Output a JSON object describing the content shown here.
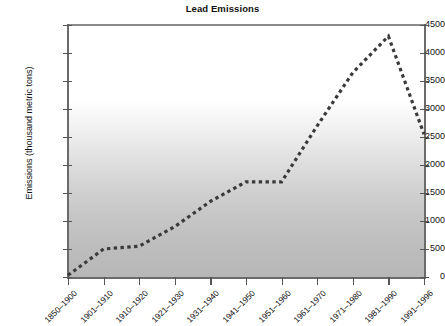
{
  "chart_data": {
    "type": "line",
    "title": "Lead Emissions",
    "xlabel": "",
    "ylabel": "Emissions (thousand metric tons)",
    "ylim": [
      0,
      4500
    ],
    "ytick_step": 500,
    "yticks": [
      0,
      500,
      1000,
      1500,
      2000,
      2500,
      3000,
      3500,
      4000,
      4500
    ],
    "ytick_labels": [
      "0",
      "500",
      "1000",
      "1500",
      "2000",
      "2500",
      "3000",
      "3500",
      "4000",
      "4500"
    ],
    "grid": false,
    "legend": "none",
    "line_style": "dotted",
    "line_color": "#3a3a3a",
    "plot_background": "vertical gradient white to gray",
    "categories": [
      "1850–1900",
      "1901–1910",
      "1910–1920",
      "1921–1930",
      "1931–1940",
      "1941–1950",
      "1951–1960",
      "1961–1970",
      "1971–1980",
      "1981–1990",
      "1991–1996"
    ],
    "values": [
      30,
      500,
      550,
      900,
      1350,
      1700,
      1700,
      2700,
      3650,
      4300,
      2550
    ]
  }
}
